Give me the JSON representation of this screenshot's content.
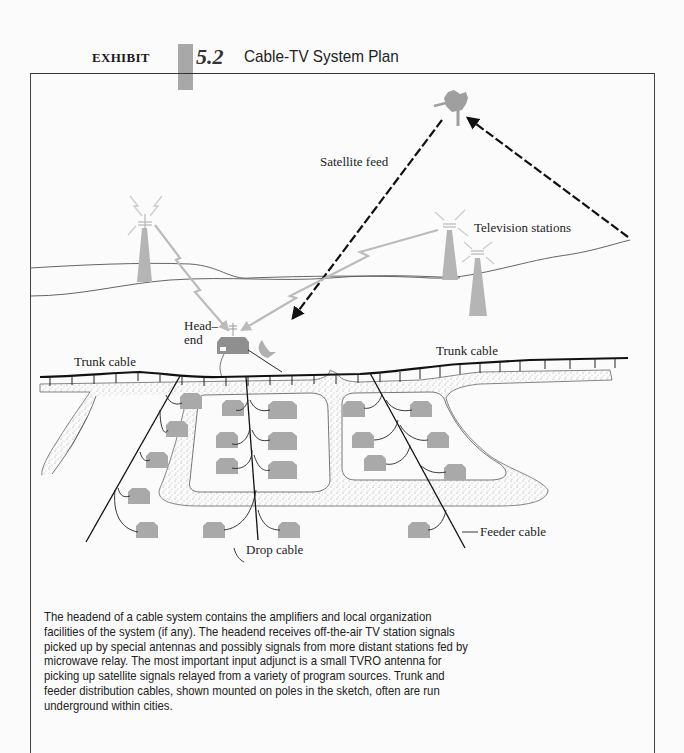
{
  "header": {
    "exhibit_word": "EXHIBIT",
    "exhibit_number": "5.2",
    "title": "Cable-TV System Plan",
    "tab_color": "#a8a8a8"
  },
  "illustration": {
    "labels": {
      "satellite_feed": "Satellite feed",
      "television_stations": "Television stations",
      "headend_line1": "Head–",
      "headend_line2": "end",
      "trunk_cable_left": "Trunk cable",
      "trunk_cable_right": "Trunk cable",
      "feeder_cable": "Feeder cable",
      "drop_cable": "Drop cable"
    },
    "icons": [
      "satellite-icon",
      "tv-tower-icon",
      "headend-building-icon",
      "tvro-dish-icon",
      "house-icon",
      "microwave-signal-icon"
    ],
    "colors": {
      "signal_gray": "#b8b8b8",
      "house_gray": "#a9a9a9",
      "line_black": "#111111"
    }
  },
  "caption": {
    "lines": [
      "The headend of a cable system contains the amplifiers and local organization",
      "facilities of the system (if any). The headend receives off-the-air TV station signals",
      "picked up by special antennas and possibly signals from more distant stations fed by",
      "microwave relay. The most important input adjunct is a small TVRO antenna for",
      "picking up satellite signals relayed from a variety of program sources. Trunk and",
      "feeder distribution cables, shown mounted on poles in the sketch, often are run",
      "underground within cities."
    ]
  }
}
